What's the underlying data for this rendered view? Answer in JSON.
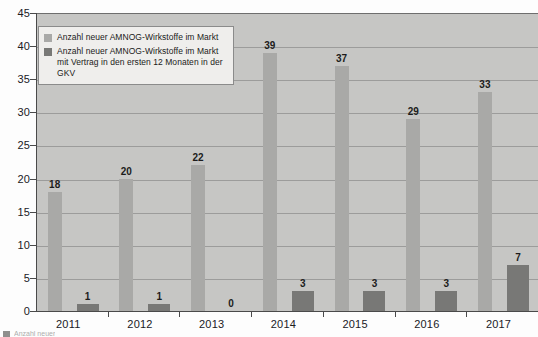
{
  "chart_data": {
    "type": "bar",
    "title": "",
    "subtitle": "",
    "xlabel": "",
    "ylabel": "",
    "categories": [
      "2011",
      "2012",
      "2013",
      "2014",
      "2015",
      "2016",
      "2017"
    ],
    "series": [
      {
        "name": "Anzahl neuer AMNOG-Wirkstoffe im Markt",
        "color": "#a9a9a7",
        "values": [
          18,
          20,
          22,
          39,
          37,
          29,
          33
        ]
      },
      {
        "name": "Anzahl neuer AMNOG-Wirkstoffe im Markt mit Vertrag in den ersten 12 Monaten in der GKV",
        "color": "#787876",
        "values": [
          1,
          1,
          0,
          3,
          3,
          3,
          7
        ]
      }
    ],
    "ylim": [
      0,
      45
    ],
    "yticks": [
      0,
      5,
      10,
      15,
      20,
      25,
      30,
      35,
      40,
      45
    ],
    "ytick_labels": [
      "0",
      "5",
      "10",
      "15",
      "20",
      "25",
      "30",
      "35",
      "40",
      "45"
    ],
    "grid": true,
    "grid_axis": "y",
    "legend_position": "upper-left",
    "data_labels": true,
    "plot_background": "#c6c6c4",
    "axis_color": "#4a4a4a",
    "gridline_color": "#8e8e8e"
  },
  "legend": {
    "items": [
      {
        "swatch_color": "#a9a9a7",
        "line1": "Anzahl neuer AMNOG-Wirkstoffe im Markt",
        "line2": ""
      },
      {
        "swatch_color": "#787876",
        "line1": "Anzahl neuer AMNOG-Wirkstoffe im Markt",
        "line2": "mit Vertrag in den ersten 12 Monaten in der GKV"
      }
    ]
  },
  "footer": {
    "cutoff_text": "Anzahl neuer"
  }
}
